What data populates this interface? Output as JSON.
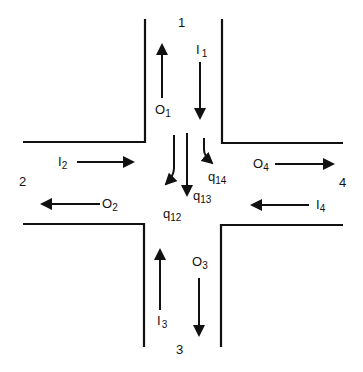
{
  "diagram": {
    "approaches": [
      {
        "id": "1",
        "label": "1",
        "inflow": {
          "base": "I",
          "sub": "1"
        },
        "outflow": {
          "base": "O",
          "sub": "1"
        }
      },
      {
        "id": "2",
        "label": "2",
        "inflow": {
          "base": "I",
          "sub": "2"
        },
        "outflow": {
          "base": "O",
          "sub": "2"
        }
      },
      {
        "id": "3",
        "label": "3",
        "inflow": {
          "base": "I",
          "sub": "3"
        },
        "outflow": {
          "base": "O",
          "sub": "3"
        }
      },
      {
        "id": "4",
        "label": "4",
        "inflow": {
          "base": "I",
          "sub": "4"
        },
        "outflow": {
          "base": "O",
          "sub": "4"
        }
      }
    ],
    "turning_flows": [
      {
        "base": "q",
        "sub": "12",
        "from": "1",
        "to": "2"
      },
      {
        "base": "q",
        "sub": "13",
        "from": "1",
        "to": "3"
      },
      {
        "base": "q",
        "sub": "14",
        "from": "1",
        "to": "4"
      }
    ]
  }
}
